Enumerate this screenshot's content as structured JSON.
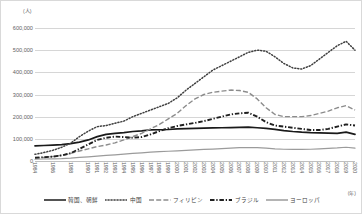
{
  "axis": {
    "unit_label": "(人)",
    "year_note": "(年)",
    "y_ticks": [
      "600,000",
      "500,000",
      "400,000",
      "300,000",
      "200,000",
      "100,000",
      "0"
    ],
    "y_tick_values": [
      600000,
      500000,
      400000,
      300000,
      200000,
      100000,
      0
    ]
  },
  "legend": {
    "items": [
      {
        "label": "韓国、朝鮮",
        "style": "solid",
        "color": "#1a1a1a",
        "name": "korea"
      },
      {
        "label": "中国",
        "style": "dotted",
        "color": "#404040",
        "name": "china"
      },
      {
        "label": "フィリピン",
        "style": "dashdot",
        "color": "#8c8c8c",
        "name": "philippines"
      },
      {
        "label": "ブラジル",
        "style": "dashdot-bold",
        "color": "#1f1f1f",
        "name": "brazil"
      },
      {
        "label": "ヨーロッパ",
        "style": "solid-gray",
        "color": "#9b9b9b",
        "name": "europe"
      }
    ]
  },
  "chart_data": {
    "type": "line",
    "title": "",
    "xlabel": "(年)",
    "ylabel": "(人)",
    "ylim": [
      0,
      600000
    ],
    "grid": true,
    "legend_position": "bottom",
    "categories": [
      "1984",
      "1985",
      "1986",
      "1987",
      "1988",
      "1989",
      "1990",
      "1991",
      "1992",
      "1993",
      "1994",
      "1995",
      "1996",
      "1997",
      "1998",
      "1999",
      "2000",
      "2001",
      "2002",
      "2003",
      "2004",
      "2005",
      "2006",
      "2007",
      "2008",
      "2009",
      "2010",
      "2011",
      "2012",
      "2013",
      "2014",
      "2015",
      "2016",
      "2017",
      "2018",
      "2019",
      "2020"
    ],
    "tick_labels": [
      "1984",
      "1986",
      "1988",
      "1990",
      "1991",
      "1992",
      "1993",
      "1994",
      "1995",
      "1996",
      "1997",
      "1998",
      "1999",
      "2000",
      "2001",
      "2002",
      "2003",
      "2004",
      "2005",
      "2006",
      "2007",
      "2008",
      "2009",
      "2010",
      "2011",
      "2012",
      "2013",
      "2014",
      "2015",
      "2016",
      "2017",
      "2018",
      "2019",
      "2020"
    ],
    "series": [
      {
        "name": "韓国、朝鮮",
        "style": "solid",
        "color": "#1a1a1a",
        "values": [
          68000,
          70000,
          72000,
          74000,
          78000,
          85000,
          95000,
          110000,
          120000,
          125000,
          128000,
          133000,
          136000,
          140000,
          141000,
          142000,
          145000,
          146000,
          147000,
          148000,
          149000,
          150000,
          151000,
          152000,
          153000,
          150000,
          147000,
          143000,
          137000,
          133000,
          130000,
          128000,
          127000,
          126000,
          125000,
          130000,
          120000
        ]
      },
      {
        "name": "中国",
        "style": "dotted",
        "color": "#404040",
        "values": [
          30000,
          38000,
          48000,
          62000,
          80000,
          110000,
          135000,
          155000,
          160000,
          170000,
          180000,
          200000,
          215000,
          230000,
          245000,
          260000,
          285000,
          320000,
          350000,
          380000,
          410000,
          430000,
          450000,
          470000,
          490000,
          500000,
          495000,
          470000,
          440000,
          420000,
          415000,
          430000,
          460000,
          490000,
          520000,
          540000,
          500000
        ]
      },
      {
        "name": "フィリピン",
        "style": "dashdot",
        "color": "#8c8c8c",
        "values": [
          12000,
          16000,
          20000,
          26000,
          34000,
          45000,
          55000,
          65000,
          72000,
          82000,
          95000,
          110000,
          125000,
          145000,
          165000,
          190000,
          215000,
          250000,
          280000,
          300000,
          310000,
          315000,
          320000,
          318000,
          310000,
          280000,
          240000,
          210000,
          200000,
          200000,
          200000,
          205000,
          215000,
          225000,
          240000,
          250000,
          230000
        ]
      },
      {
        "name": "ブラジル",
        "style": "dashdot-bold",
        "color": "#1f1f1f",
        "values": [
          15000,
          17000,
          20000,
          25000,
          35000,
          55000,
          75000,
          95000,
          105000,
          110000,
          108000,
          105000,
          108000,
          120000,
          135000,
          148000,
          158000,
          165000,
          172000,
          180000,
          190000,
          200000,
          210000,
          215000,
          218000,
          200000,
          175000,
          160000,
          155000,
          150000,
          145000,
          140000,
          140000,
          145000,
          155000,
          165000,
          160000
        ]
      },
      {
        "name": "ヨーロッパ",
        "style": "solid-gray",
        "color": "#9b9b9b",
        "values": [
          8000,
          9000,
          10000,
          11000,
          13000,
          16000,
          19000,
          22000,
          25000,
          28000,
          31000,
          34000,
          37000,
          40000,
          42000,
          44000,
          46000,
          48000,
          50000,
          52000,
          54000,
          56000,
          58000,
          60000,
          61000,
          60000,
          58000,
          55000,
          53000,
          52000,
          52000,
          53000,
          55000,
          57000,
          59000,
          62000,
          58000
        ]
      }
    ]
  }
}
